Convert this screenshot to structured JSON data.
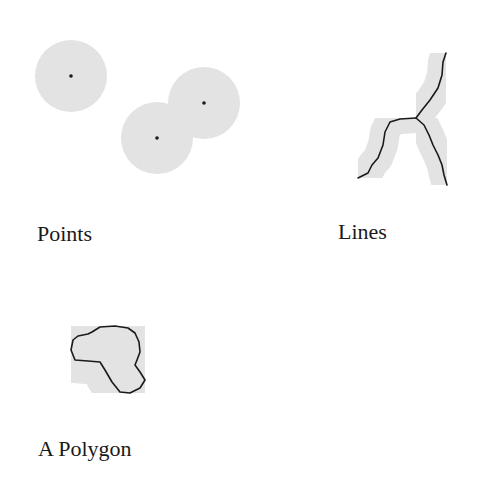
{
  "diagram": {
    "type": "buffer-illustration",
    "colors": {
      "buffer_fill": "#e1e1e1",
      "feature_stroke": "#1a1a1a",
      "label_text": "#1a1a1a",
      "background": "#ffffff"
    },
    "panels": [
      {
        "id": "points",
        "label": "Points",
        "features": [
          {
            "type": "point",
            "x": 71,
            "y": 76,
            "buffer_radius": 36
          },
          {
            "type": "point",
            "x": 204,
            "y": 103,
            "buffer_radius": 36
          },
          {
            "type": "point",
            "x": 157,
            "y": 138,
            "buffer_radius": 36
          }
        ]
      },
      {
        "id": "lines",
        "label": "Lines",
        "features": [
          {
            "type": "line",
            "name": "trunk",
            "points": [
              [
                446,
                53
              ],
              [
                443,
                62
              ],
              [
                442,
                75
              ],
              [
                438,
                88
              ],
              [
                430,
                100
              ],
              [
                422,
                110
              ],
              [
                416,
                118
              ]
            ]
          },
          {
            "type": "line",
            "name": "left-branch",
            "points": [
              [
                416,
                118
              ],
              [
                400,
                119
              ],
              [
                390,
                122
              ],
              [
                385,
                132
              ],
              [
                383,
                145
              ],
              [
                378,
                158
              ],
              [
                372,
                165
              ],
              [
                368,
                173
              ],
              [
                358,
                178
              ]
            ]
          },
          {
            "type": "line",
            "name": "right-branch",
            "points": [
              [
                416,
                118
              ],
              [
                424,
                125
              ],
              [
                429,
                135
              ],
              [
                433,
                145
              ],
              [
                438,
                155
              ],
              [
                442,
                165
              ],
              [
                444,
                175
              ],
              [
                447,
                185
              ]
            ]
          }
        ],
        "buffer_width": 30
      },
      {
        "id": "polygon",
        "label": "A Polygon",
        "features": [
          {
            "type": "polygon",
            "points": [
              [
                73,
                340
              ],
              [
                78,
                336
              ],
              [
                88,
                334
              ],
              [
                92,
                332
              ],
              [
                100,
                327
              ],
              [
                115,
                326
              ],
              [
                128,
                328
              ],
              [
                135,
                333
              ],
              [
                139,
                342
              ],
              [
                140,
                352
              ],
              [
                137,
                360
              ],
              [
                135,
                365
              ],
              [
                140,
                372
              ],
              [
                145,
                380
              ],
              [
                140,
                388
              ],
              [
                130,
                393
              ],
              [
                120,
                392
              ],
              [
                112,
                382
              ],
              [
                105,
                370
              ],
              [
                100,
                362
              ],
              [
                88,
                361
              ],
              [
                75,
                360
              ],
              [
                71,
                350
              ]
            ]
          }
        ]
      }
    ]
  }
}
